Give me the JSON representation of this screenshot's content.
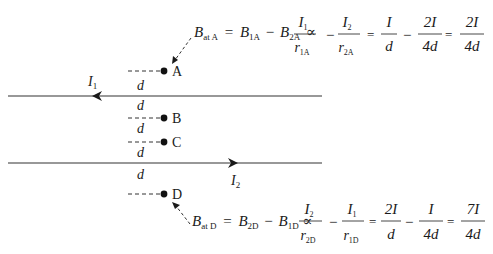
{
  "wires": [
    {
      "id": "wire-1",
      "current_label": "I",
      "current_sub": "1",
      "direction": "left",
      "y": 96
    },
    {
      "id": "wire-2",
      "current_label": "I",
      "current_sub": "2",
      "direction": "right",
      "y": 163
    }
  ],
  "points": [
    {
      "label": "A",
      "gap_above": "",
      "gap_below": "d"
    },
    {
      "label": "B",
      "gap_above": "d",
      "gap_below": "d"
    },
    {
      "label": "C",
      "gap_above": "",
      "gap_below": "d"
    },
    {
      "label": "D",
      "gap_above": "d",
      "gap_below": ""
    }
  ],
  "distance_label": "d",
  "equation_A": {
    "lhs": "B",
    "lhs_sub": "at A",
    "t1": "B",
    "t1_sub": "1A",
    "minus": "−",
    "t2": "B",
    "t2_sub": "2A",
    "prop": "∝",
    "f1_num": "I",
    "f1_num_sub": "1",
    "f1_den": "r",
    "f1_den_sub": "1A",
    "f2_num": "I",
    "f2_num_sub": "2",
    "f2_den": "r",
    "f2_den_sub": "2A",
    "eq": "=",
    "f3_num": "I",
    "f3_den": "d",
    "f4_num": "2I",
    "f4_den": "4d",
    "f5_num": "2I",
    "f5_den": "4d"
  },
  "equation_D": {
    "lhs": "B",
    "lhs_sub": "at D",
    "t1": "B",
    "t1_sub": "2D",
    "minus": "−",
    "t2": "B",
    "t2_sub": "1D",
    "prop": "∝",
    "f1_num": "I",
    "f1_num_sub": "2",
    "f1_den": "r",
    "f1_den_sub": "2D",
    "f2_num": "I",
    "f2_num_sub": "1",
    "f2_den": "r",
    "f2_den_sub": "1D",
    "eq": "=",
    "f3_num": "2I",
    "f3_den": "d",
    "f4_num": "I",
    "f4_den": "4d",
    "f5_num": "7I",
    "f5_den": "4d"
  }
}
